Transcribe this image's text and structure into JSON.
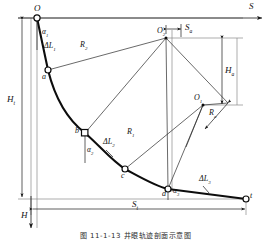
{
  "figure": {
    "type": "engineering-diagram",
    "caption": "图 11-1-13  井眼轨迹剖面示意图"
  },
  "axes": {
    "horizontal_label": "S",
    "vertical_label": "H"
  },
  "nodes": [
    {
      "id": "O",
      "label": "O",
      "x": 37,
      "y": 18,
      "marker": "circle"
    },
    {
      "id": "a",
      "label": "a",
      "x": 48,
      "y": 70,
      "marker": "circle"
    },
    {
      "id": "b",
      "label": "b",
      "x": 85,
      "y": 133,
      "marker": "square"
    },
    {
      "id": "c",
      "label": "c",
      "x": 125,
      "y": 169,
      "marker": "circle"
    },
    {
      "id": "d",
      "label": "d",
      "x": 168,
      "y": 189,
      "marker": "circle"
    },
    {
      "id": "t",
      "label": "t",
      "x": 246,
      "y": 199,
      "marker": "circle"
    },
    {
      "id": "O2",
      "label": "O",
      "sub": "2",
      "x": 166,
      "y": 38,
      "marker": "dot"
    },
    {
      "id": "O1",
      "label": "O",
      "sub": "1",
      "x": 203,
      "y": 105,
      "marker": "dot"
    }
  ],
  "segment_labels": [
    {
      "name": "delta-L1",
      "text": "ΔL",
      "sub": "1",
      "x": 52,
      "y": 47
    },
    {
      "name": "delta-L2",
      "text": "ΔL",
      "sub": "2",
      "x": 110,
      "y": 145
    },
    {
      "name": "delta-L3",
      "text": "ΔL",
      "sub": "3",
      "x": 205,
      "y": 181
    }
  ],
  "angle_labels": [
    {
      "name": "alpha-1",
      "text": "α",
      "sub": "1",
      "x": 46,
      "y": 33
    },
    {
      "name": "alpha-2",
      "text": "α",
      "sub": "2",
      "x": 90,
      "y": 152
    },
    {
      "name": "alpha-3",
      "text": "α",
      "sub": "3",
      "x": 176,
      "y": 193
    }
  ],
  "radius_labels": [
    {
      "name": "radius-R2",
      "text": "R",
      "sub": "2",
      "x": 84,
      "y": 47
    },
    {
      "name": "radius-R1",
      "text": "R",
      "sub": "1",
      "x": 131,
      "y": 134
    },
    {
      "name": "radius-Ra",
      "text": "R",
      "sub": "a",
      "x": 213,
      "y": 115
    }
  ],
  "dimension_labels": [
    {
      "name": "dim-Ht",
      "text": "H",
      "sub": "t",
      "x": 11,
      "y": 101
    },
    {
      "name": "dim-Ha",
      "text": "H",
      "sub": "a",
      "x": 228,
      "y": 72
    },
    {
      "name": "dim-Sa",
      "text": "S",
      "sub": "a",
      "x": 187,
      "y": 30
    },
    {
      "name": "dim-St",
      "text": "S",
      "sub": "t",
      "x": 135,
      "y": 210
    }
  ],
  "axis_labels": [
    {
      "name": "axis-S",
      "text": "S",
      "x": 250,
      "y": 8
    },
    {
      "name": "axis-H",
      "text": "H",
      "x": 25,
      "y": 218
    }
  ]
}
